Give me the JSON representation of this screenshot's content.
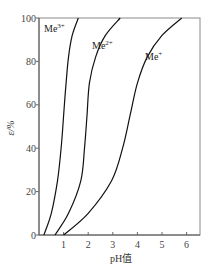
{
  "chart_data": {
    "type": "line",
    "title": "",
    "xlabel": "pH值",
    "ylabel": "ε/%",
    "xlim": [
      0,
      6.5
    ],
    "ylim": [
      0,
      100
    ],
    "xticks": [
      1,
      2,
      3,
      4,
      5,
      6
    ],
    "yticks": [
      0,
      20,
      40,
      60,
      80,
      100
    ],
    "xtick_labels": [
      "1",
      "2",
      "3",
      "4",
      "5",
      "6"
    ],
    "ytick_labels": [
      "0",
      "20",
      "40",
      "60",
      "80",
      "100"
    ],
    "grid": false,
    "legend": "inline labels near curves",
    "series": [
      {
        "name": "Me3+",
        "label_base": "Me",
        "label_sup": "3+",
        "x": [
          0.2,
          0.5,
          0.75,
          0.9,
          1.0,
          1.1,
          1.2,
          1.35,
          1.6
        ],
        "y": [
          0,
          10,
          25,
          40,
          55,
          70,
          82,
          92,
          100
        ]
      },
      {
        "name": "Me2+",
        "label_base": "Me",
        "label_sup": "2+",
        "x": [
          0.65,
          1.2,
          1.7,
          1.85,
          1.95,
          2.05,
          2.3,
          2.7,
          3.3
        ],
        "y": [
          0,
          10,
          25,
          40,
          55,
          70,
          82,
          92,
          100
        ]
      },
      {
        "name": "Me+",
        "label_base": "Me",
        "label_sup": "+",
        "x": [
          1.0,
          2.0,
          2.95,
          3.4,
          3.7,
          4.0,
          4.4,
          5.0,
          5.8
        ],
        "y": [
          0,
          10,
          25,
          40,
          55,
          70,
          82,
          92,
          100
        ]
      }
    ]
  }
}
